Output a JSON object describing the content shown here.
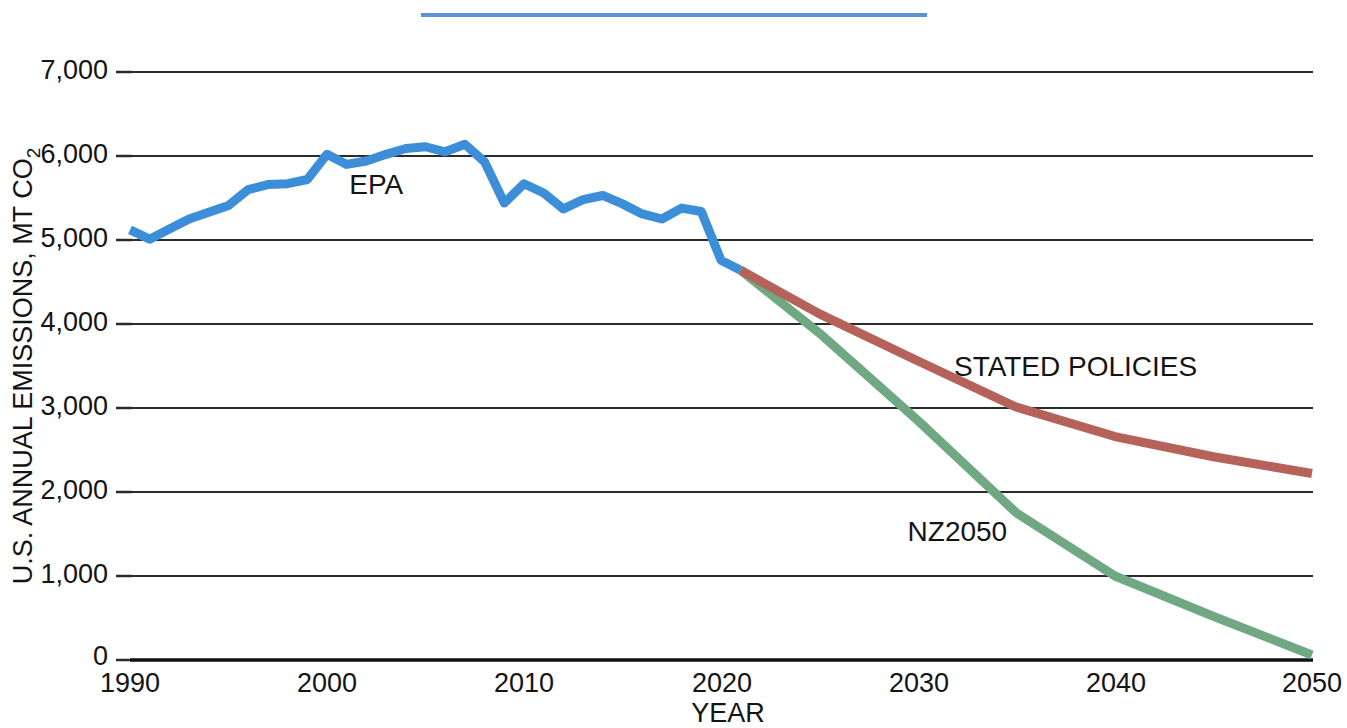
{
  "chart": {
    "type": "line",
    "title": "",
    "xlabel": "YEAR",
    "ylabel_line1": "U.S. ANNUAL EMISSIONS, MT CO",
    "ylabel_sub": "2",
    "ylabel_full": "U.S. ANNUAL EMISSIONS, MT CO2",
    "y_ticks": [
      "0",
      "1,000",
      "2,000",
      "3,000",
      "4,000",
      "5,000",
      "6,000",
      "7,000"
    ],
    "x_ticks": [
      "1990",
      "2000",
      "2010",
      "2020",
      "2030",
      "2040",
      "2050"
    ],
    "xlim": [
      1990,
      2050
    ],
    "ylim": [
      0,
      7000
    ],
    "grid": "horizontal",
    "legend_position": "inline-labels",
    "colors": {
      "epa": "#3d8ed9",
      "stated_policies": "#b5635a",
      "nz2050": "#6fa882",
      "axis": "#101010",
      "grid": "#2b2b2b",
      "text": "#141414"
    },
    "series_labels": {
      "epa": "EPA",
      "stated_policies": "STATED POLICIES",
      "nz2050": "NZ2050"
    }
  },
  "chart_data": {
    "type": "line",
    "title": "",
    "xlabel": "YEAR",
    "ylabel": "U.S. ANNUAL EMISSIONS, MT CO2",
    "xlim": [
      1990,
      2050
    ],
    "ylim": [
      0,
      7000
    ],
    "y_ticks": [
      0,
      1000,
      2000,
      3000,
      4000,
      5000,
      6000,
      7000
    ],
    "x_ticks": [
      1990,
      2000,
      2010,
      2020,
      2030,
      2040,
      2050
    ],
    "grid": "horizontal gridlines only",
    "legend_position": "inline data labels",
    "series": [
      {
        "name": "EPA",
        "color": "#3d8ed9",
        "kind": "historical",
        "x": [
          1990,
          1991,
          1992,
          1993,
          1994,
          1995,
          1996,
          1997,
          1998,
          1999,
          2000,
          2001,
          2002,
          2003,
          2004,
          2005,
          2006,
          2007,
          2008,
          2009,
          2010,
          2011,
          2012,
          2013,
          2014,
          2015,
          2016,
          2017,
          2018,
          2019,
          2020,
          2021
        ],
        "values": [
          5120,
          5010,
          5130,
          5250,
          5330,
          5410,
          5600,
          5660,
          5670,
          5720,
          6020,
          5900,
          5940,
          6020,
          6090,
          6110,
          6050,
          6140,
          5930,
          5440,
          5670,
          5560,
          5370,
          5480,
          5530,
          5430,
          5310,
          5250,
          5380,
          5340,
          4760,
          4640
        ]
      },
      {
        "name": "STATED POLICIES",
        "color": "#b5635a",
        "kind": "projection",
        "x": [
          2021,
          2025,
          2030,
          2035,
          2040,
          2045,
          2050
        ],
        "values": [
          4640,
          4120,
          3560,
          3010,
          2660,
          2420,
          2220
        ]
      },
      {
        "name": "NZ2050",
        "color": "#6fa882",
        "kind": "projection",
        "x": [
          2021,
          2025,
          2030,
          2035,
          2040,
          2045,
          2050
        ],
        "values": [
          4640,
          3890,
          2850,
          1750,
          1000,
          520,
          60
        ]
      }
    ],
    "annotations": [
      {
        "text": "EPA",
        "x": 2002.5,
        "y": 5550
      },
      {
        "text": "STATED POLICIES",
        "x": 2038,
        "y": 3380
      },
      {
        "text": "NZ2050",
        "x": 2032,
        "y": 1420
      }
    ]
  },
  "decorations": {
    "top_rule_label": "blue-rule"
  }
}
